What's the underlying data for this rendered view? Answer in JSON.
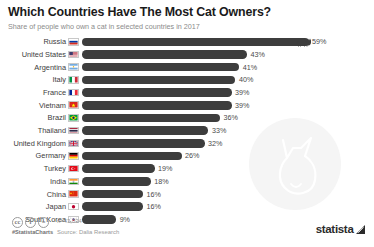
{
  "header": {
    "title": "Which Countries Have The Most Cat Owners?",
    "subtitle": "Share of people who own a cat in selected countries in 2017"
  },
  "footer": {
    "cc_badges": [
      "cc",
      "i",
      "="
    ],
    "hashtag": "#StatistaCharts",
    "sample_size": "n=43,034",
    "source": "Source: Dalia Research",
    "brand": "statista",
    "brand_mark_icon": "statista-arrow-icon"
  },
  "colors": {
    "bar": "#3d3d3d",
    "background": "#ffffff",
    "label_text": "#3c3c3c",
    "value_text": "#4a4a4a",
    "subtitle_text": "#8b8b8b",
    "watermark": "#f5f5f5"
  },
  "chart_data": {
    "type": "bar",
    "orientation": "horizontal",
    "title": "Which Countries Have The Most Cat Owners?",
    "subtitle": "Share of people who own a cat in selected countries in 2017",
    "xlabel": "",
    "ylabel": "",
    "unit": "%",
    "xlim": [
      0,
      59
    ],
    "grid": false,
    "legend": false,
    "categories": [
      "Russia",
      "United States",
      "Argentina",
      "Italy",
      "France",
      "Vietnam",
      "Brazil",
      "Thailand",
      "United Kingdom",
      "Germany",
      "Turkey",
      "India",
      "China",
      "Japan",
      "South Korea"
    ],
    "values": [
      59,
      43,
      41,
      40,
      39,
      39,
      36,
      33,
      32,
      26,
      19,
      18,
      16,
      16,
      9
    ],
    "value_labels": [
      "59%",
      "43%",
      "41%",
      "40%",
      "39%",
      "39%",
      "36%",
      "33%",
      "32%",
      "26%",
      "19%",
      "18%",
      "16%",
      "16%",
      "9%"
    ],
    "rows": [
      {
        "label": "Russia",
        "value": 59,
        "value_label": "59%",
        "flag": "flag-russia",
        "marker": "cat-icon"
      },
      {
        "label": "United States",
        "value": 43,
        "value_label": "43%",
        "flag": "flag-united-states",
        "marker": ""
      },
      {
        "label": "Argentina",
        "value": 41,
        "value_label": "41%",
        "flag": "flag-argentina",
        "marker": ""
      },
      {
        "label": "Italy",
        "value": 40,
        "value_label": "40%",
        "flag": "flag-italy",
        "marker": ""
      },
      {
        "label": "France",
        "value": 39,
        "value_label": "39%",
        "flag": "flag-france",
        "marker": ""
      },
      {
        "label": "Vietnam",
        "value": 39,
        "value_label": "39%",
        "flag": "flag-vietnam",
        "marker": ""
      },
      {
        "label": "Brazil",
        "value": 36,
        "value_label": "36%",
        "flag": "flag-brazil",
        "marker": ""
      },
      {
        "label": "Thailand",
        "value": 33,
        "value_label": "33%",
        "flag": "flag-thailand",
        "marker": ""
      },
      {
        "label": "United Kingdom",
        "value": 32,
        "value_label": "32%",
        "flag": "flag-united-kingdom",
        "marker": ""
      },
      {
        "label": "Germany",
        "value": 26,
        "value_label": "26%",
        "flag": "flag-germany",
        "marker": ""
      },
      {
        "label": "Turkey",
        "value": 19,
        "value_label": "19%",
        "flag": "flag-turkey",
        "marker": ""
      },
      {
        "label": "India",
        "value": 18,
        "value_label": "18%",
        "flag": "flag-india",
        "marker": ""
      },
      {
        "label": "China",
        "value": 16,
        "value_label": "16%",
        "flag": "flag-china",
        "marker": ""
      },
      {
        "label": "Japan",
        "value": 16,
        "value_label": "16%",
        "flag": "flag-japan",
        "marker": ""
      },
      {
        "label": "South Korea",
        "value": 9,
        "value_label": "9%",
        "flag": "flag-south-korea",
        "marker": ""
      }
    ]
  }
}
